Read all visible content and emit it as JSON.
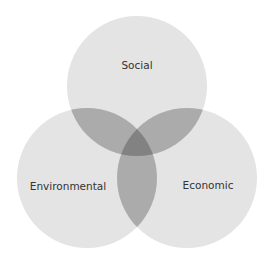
{
  "diagram": {
    "type": "venn",
    "sets": [
      {
        "id": "social",
        "label": "Social",
        "cx": 137,
        "cy": 86,
        "r": 70
      },
      {
        "id": "environmental",
        "label": "Environmental",
        "cx": 87,
        "cy": 178,
        "r": 70
      },
      {
        "id": "economic",
        "label": "Economic",
        "cx": 187,
        "cy": 178,
        "r": 70
      }
    ],
    "colors": {
      "single": "#e4e4e4",
      "double": "#ababab",
      "triple": "#828282",
      "label": "#333333",
      "background": "#ffffff"
    }
  }
}
